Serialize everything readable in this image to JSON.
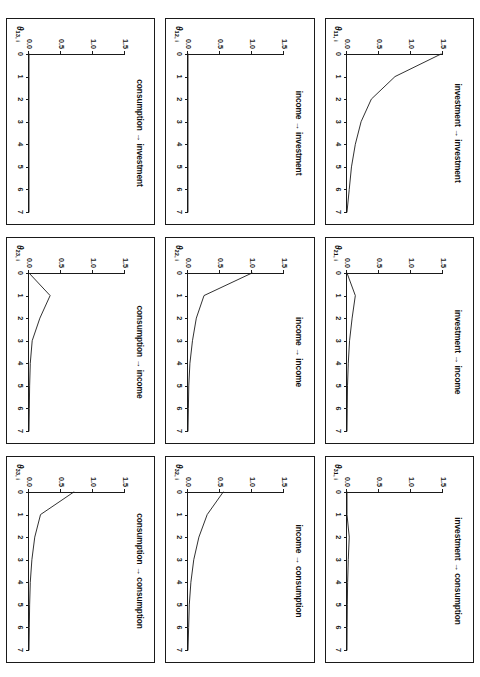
{
  "figure": {
    "orientation": "rotated-90-clockwise",
    "rows": 3,
    "cols": 3,
    "ink_color": "#1a1a1a",
    "background": "#ffffff"
  },
  "axes": {
    "x_ticks": [
      "0",
      "1",
      "2",
      "3",
      "4",
      "5",
      "6",
      "7"
    ],
    "x_values": [
      0,
      1,
      2,
      3,
      4,
      5,
      6,
      7
    ],
    "y_ticks": [
      "0.0",
      "0.5",
      "1.0",
      "1.5"
    ],
    "y_values": [
      0.0,
      0.5,
      1.0,
      1.5
    ],
    "xlim": [
      0,
      7
    ],
    "ylim": [
      0,
      1.5
    ]
  },
  "panels": [
    {
      "id": "p13",
      "title": "consumption → investment",
      "ylabel_theta": "θ",
      "ylabel_sub": "13, i",
      "row": 0,
      "col": 0,
      "values": [
        0.0,
        0.0,
        0.0,
        0.0,
        0.0,
        0.0,
        0.0,
        0.0
      ]
    },
    {
      "id": "p12",
      "title": "income → investment",
      "ylabel_theta": "θ",
      "ylabel_sub": "12, i",
      "row": 0,
      "col": 1,
      "values": [
        0.0,
        0.0,
        0.0,
        0.0,
        0.0,
        0.0,
        0.0,
        0.0
      ]
    },
    {
      "id": "p11",
      "title": "investment → investment",
      "ylabel_theta": "θ",
      "ylabel_sub": "11, i",
      "row": 0,
      "col": 2,
      "values": [
        1.47,
        0.75,
        0.38,
        0.22,
        0.13,
        0.07,
        0.035,
        0.0
      ]
    },
    {
      "id": "p23",
      "title": "consumption → income",
      "ylabel_theta": "θ",
      "ylabel_sub": "23, i",
      "row": 1,
      "col": 0,
      "values": [
        0.0,
        0.33,
        0.17,
        0.05,
        0.02,
        0.01,
        0.005,
        0.0
      ]
    },
    {
      "id": "p22",
      "title": "income → income",
      "ylabel_theta": "θ",
      "ylabel_sub": "22, i",
      "row": 1,
      "col": 1,
      "values": [
        1.0,
        0.25,
        0.13,
        0.07,
        0.03,
        0.012,
        0.006,
        0.0
      ]
    },
    {
      "id": "p21",
      "title": "investment → income",
      "ylabel_theta": "θ",
      "ylabel_sub": "21, i",
      "row": 1,
      "col": 2,
      "values": [
        0.0,
        0.13,
        0.08,
        0.04,
        0.02,
        0.008,
        0.004,
        0.0
      ]
    },
    {
      "id": "p33",
      "title": "consumption → consumption",
      "ylabel_theta": "θ",
      "ylabel_sub": "33, i",
      "row": 2,
      "col": 0,
      "values": [
        0.7,
        0.18,
        0.09,
        0.045,
        0.02,
        0.01,
        0.005,
        0.0
      ]
    },
    {
      "id": "p32",
      "title": "income → consumption",
      "ylabel_theta": "θ",
      "ylabel_sub": "32, i",
      "row": 2,
      "col": 1,
      "values": [
        0.55,
        0.3,
        0.17,
        0.09,
        0.045,
        0.02,
        0.01,
        0.0
      ]
    },
    {
      "id": "p31",
      "title": "investment → consumption",
      "ylabel_theta": "θ",
      "ylabel_sub": "31, i",
      "row": 2,
      "col": 2,
      "values": [
        0.0,
        0.0,
        0.035,
        0.02,
        0.01,
        0.005,
        0.002,
        0.0
      ]
    }
  ],
  "chart_data": {
    "type": "line",
    "title": "",
    "subtitle": "",
    "xlabel": "",
    "ylabel": "",
    "xlim": [
      0,
      7
    ],
    "ylim": [
      0,
      1.5
    ],
    "x": [
      0,
      1,
      2,
      3,
      4,
      5,
      6,
      7
    ],
    "xtick_labels": [
      "0",
      "1",
      "2",
      "3",
      "4",
      "5",
      "6",
      "7"
    ],
    "ytick_labels": [
      "0.0",
      "0.5",
      "1.0",
      "1.5"
    ],
    "grid": false,
    "legend": "none",
    "panel_layout": "3x3",
    "series": [
      {
        "name": "consumption → investment",
        "label": "θ13, i",
        "values": [
          0.0,
          0.0,
          0.0,
          0.0,
          0.0,
          0.0,
          0.0,
          0.0
        ]
      },
      {
        "name": "income → investment",
        "label": "θ12, i",
        "values": [
          0.0,
          0.0,
          0.0,
          0.0,
          0.0,
          0.0,
          0.0,
          0.0
        ]
      },
      {
        "name": "investment → investment",
        "label": "θ11, i",
        "values": [
          1.47,
          0.75,
          0.38,
          0.22,
          0.13,
          0.07,
          0.035,
          0.0
        ]
      },
      {
        "name": "consumption → income",
        "label": "θ23, i",
        "values": [
          0.0,
          0.33,
          0.17,
          0.05,
          0.02,
          0.01,
          0.005,
          0.0
        ]
      },
      {
        "name": "income → income",
        "label": "θ22, i",
        "values": [
          1.0,
          0.25,
          0.13,
          0.07,
          0.03,
          0.012,
          0.006,
          0.0
        ]
      },
      {
        "name": "investment → income",
        "label": "θ21, i",
        "values": [
          0.0,
          0.13,
          0.08,
          0.04,
          0.02,
          0.008,
          0.004,
          0.0
        ]
      },
      {
        "name": "consumption → consumption",
        "label": "θ33, i",
        "values": [
          0.7,
          0.18,
          0.09,
          0.045,
          0.02,
          0.01,
          0.005,
          0.0
        ]
      },
      {
        "name": "income → consumption",
        "label": "θ32, i",
        "values": [
          0.55,
          0.3,
          0.17,
          0.09,
          0.045,
          0.02,
          0.01,
          0.0
        ]
      },
      {
        "name": "investment → consumption",
        "label": "θ31, i",
        "values": [
          0.0,
          0.0,
          0.035,
          0.02,
          0.01,
          0.005,
          0.002,
          0.0
        ]
      }
    ]
  }
}
